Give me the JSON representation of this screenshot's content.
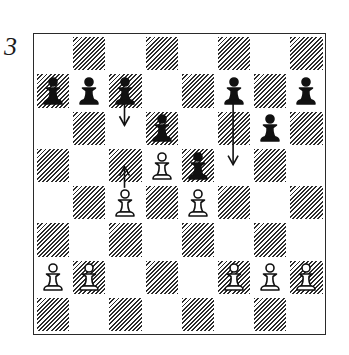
{
  "diagram": {
    "number": "3",
    "colors": {
      "ink": "#1a1a1a",
      "light_square": "#ffffff",
      "dark_square_hatch": "#2b2b2b"
    },
    "files": [
      "a",
      "b",
      "c",
      "d",
      "e",
      "f",
      "g",
      "h"
    ],
    "ranks": [
      8,
      7,
      6,
      5,
      4,
      3,
      2,
      1
    ],
    "pieces": [
      {
        "square": "a7",
        "color": "black",
        "type": "pawn"
      },
      {
        "square": "b7",
        "color": "black",
        "type": "pawn"
      },
      {
        "square": "c7",
        "color": "black",
        "type": "pawn"
      },
      {
        "square": "f7",
        "color": "black",
        "type": "pawn"
      },
      {
        "square": "h7",
        "color": "black",
        "type": "pawn"
      },
      {
        "square": "d6",
        "color": "black",
        "type": "pawn"
      },
      {
        "square": "g6",
        "color": "black",
        "type": "pawn"
      },
      {
        "square": "e5",
        "color": "black",
        "type": "pawn"
      },
      {
        "square": "d5",
        "color": "white",
        "type": "pawn"
      },
      {
        "square": "c4",
        "color": "white",
        "type": "pawn"
      },
      {
        "square": "e4",
        "color": "white",
        "type": "pawn"
      },
      {
        "square": "a2",
        "color": "white",
        "type": "pawn"
      },
      {
        "square": "b2",
        "color": "white",
        "type": "pawn"
      },
      {
        "square": "f2",
        "color": "white",
        "type": "pawn"
      },
      {
        "square": "g2",
        "color": "white",
        "type": "pawn"
      },
      {
        "square": "h2",
        "color": "white",
        "type": "pawn"
      }
    ],
    "arrows": [
      {
        "from": "c7",
        "to": "c6",
        "direction": "down"
      },
      {
        "from": "c4",
        "to": "c5",
        "direction": "up"
      },
      {
        "from": "f7",
        "to": "f5",
        "direction": "down"
      }
    ]
  }
}
